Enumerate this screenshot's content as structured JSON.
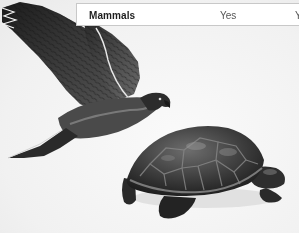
{
  "table": {
    "rows": [
      {
        "label": "Mammals",
        "cells": [
          "Yes",
          "Y"
        ]
      }
    ]
  },
  "illustrations": [
    {
      "name": "hawk-illustration",
      "subject": "hawk in flight"
    },
    {
      "name": "turtle-illustration",
      "subject": "turtle"
    }
  ],
  "colors": {
    "background": "#f4f4f4",
    "table_border": "#c8c8c8",
    "text": "#2a2a2a"
  }
}
